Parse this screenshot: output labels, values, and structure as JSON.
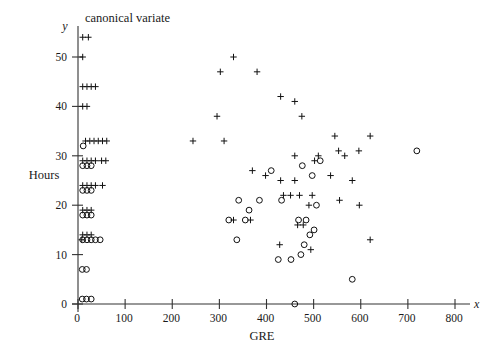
{
  "chart_data": {
    "type": "scatter",
    "title": "canonical variate",
    "xlabel": "GRE",
    "ylabel": "Hours",
    "x_axis_symbol": "x",
    "y_axis_symbol": "y",
    "xlim": [
      0,
      800
    ],
    "ylim": [
      0,
      55
    ],
    "grid": false,
    "legend": "none",
    "xticks": [
      0,
      100,
      200,
      300,
      400,
      500,
      600,
      700,
      800
    ],
    "xtick_labels": [
      "0",
      "100",
      "200",
      "300",
      "400",
      "500",
      "600",
      "700",
      "800"
    ],
    "yticks": [
      0,
      10,
      20,
      30,
      40,
      50
    ],
    "ytick_labels": [
      "0",
      "10",
      "20",
      "30",
      "40",
      "50"
    ],
    "series": [
      {
        "name": "plus",
        "marker": "plus",
        "points": [
          [
            10,
            54
          ],
          [
            22,
            54
          ],
          [
            10,
            50
          ],
          [
            10,
            44
          ],
          [
            19,
            44
          ],
          [
            28,
            44
          ],
          [
            37,
            44
          ],
          [
            10,
            40
          ],
          [
            19,
            40
          ],
          [
            16,
            33
          ],
          [
            25,
            33
          ],
          [
            34,
            33
          ],
          [
            43,
            33
          ],
          [
            52,
            33
          ],
          [
            61,
            33
          ],
          [
            10,
            29
          ],
          [
            19,
            29
          ],
          [
            28,
            29
          ],
          [
            37,
            29
          ],
          [
            50,
            29
          ],
          [
            59,
            29
          ],
          [
            10,
            24
          ],
          [
            19,
            24
          ],
          [
            28,
            24
          ],
          [
            37,
            24
          ],
          [
            52,
            24
          ],
          [
            10,
            19
          ],
          [
            19,
            19
          ],
          [
            28,
            19
          ],
          [
            10,
            14
          ],
          [
            19,
            14
          ],
          [
            28,
            14
          ],
          [
            8,
            13
          ],
          [
            330,
            50
          ],
          [
            302,
            47
          ],
          [
            380,
            47
          ],
          [
            430,
            42
          ],
          [
            460,
            41
          ],
          [
            295,
            38
          ],
          [
            475,
            38
          ],
          [
            244,
            33
          ],
          [
            310,
            33
          ],
          [
            545,
            34
          ],
          [
            620,
            34
          ],
          [
            460,
            30
          ],
          [
            510,
            30
          ],
          [
            553,
            31
          ],
          [
            566,
            30
          ],
          [
            596,
            31
          ],
          [
            502,
            29
          ],
          [
            370,
            27
          ],
          [
            398,
            26
          ],
          [
            430,
            25
          ],
          [
            460,
            25
          ],
          [
            536,
            26
          ],
          [
            582,
            25
          ],
          [
            436,
            22
          ],
          [
            451,
            22
          ],
          [
            470,
            22
          ],
          [
            497,
            22
          ],
          [
            555,
            21
          ],
          [
            490,
            20
          ],
          [
            597,
            20
          ],
          [
            330,
            17
          ],
          [
            366,
            17
          ],
          [
            466,
            16
          ],
          [
            478,
            16
          ],
          [
            620,
            13
          ],
          [
            428,
            12
          ],
          [
            494,
            11
          ]
        ]
      },
      {
        "name": "circle",
        "marker": "circle",
        "points": [
          [
            11,
            32
          ],
          [
            10,
            28
          ],
          [
            19,
            28
          ],
          [
            28,
            28
          ],
          [
            10,
            23
          ],
          [
            19,
            23
          ],
          [
            28,
            23
          ],
          [
            10,
            18
          ],
          [
            19,
            18
          ],
          [
            28,
            18
          ],
          [
            10,
            13
          ],
          [
            19,
            13
          ],
          [
            28,
            13
          ],
          [
            37,
            13
          ],
          [
            47,
            13
          ],
          [
            9,
            7
          ],
          [
            18,
            7
          ],
          [
            9,
            1
          ],
          [
            18,
            1
          ],
          [
            28,
            1
          ],
          [
            719,
            31
          ],
          [
            514,
            29
          ],
          [
            476,
            28
          ],
          [
            410,
            27
          ],
          [
            497,
            26
          ],
          [
            341,
            21
          ],
          [
            385,
            21
          ],
          [
            432,
            21
          ],
          [
            506,
            20
          ],
          [
            363,
            19
          ],
          [
            320,
            17
          ],
          [
            355,
            17
          ],
          [
            468,
            17
          ],
          [
            484,
            17
          ],
          [
            501,
            15
          ],
          [
            492,
            14
          ],
          [
            337,
            13
          ],
          [
            480,
            12
          ],
          [
            473,
            10
          ],
          [
            425,
            9
          ],
          [
            452,
            9
          ],
          [
            582,
            5
          ],
          [
            460,
            0
          ]
        ]
      }
    ]
  }
}
